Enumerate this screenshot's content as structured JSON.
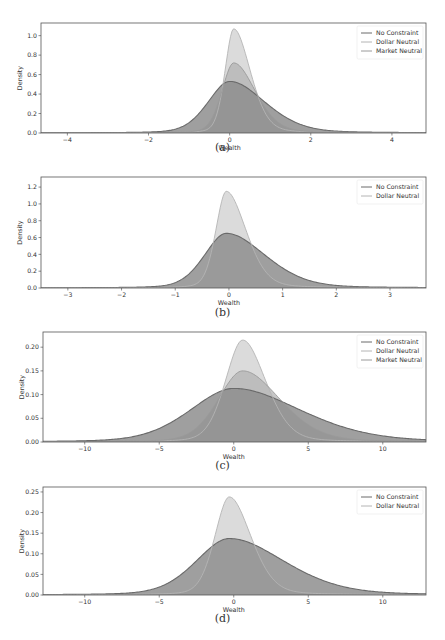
{
  "figure": {
    "captions": [
      "(a)",
      "(b)",
      "(c)",
      "(d)"
    ]
  },
  "colors": {
    "no_constraint": "#6a6a6a",
    "dollar_neutral": "#b4b4b4",
    "market_neutral": "#9a9a9a",
    "frame": "#555555"
  },
  "chart_data": [
    {
      "id": "a",
      "type": "area",
      "title": "",
      "xlabel": "Wealth",
      "ylabel": "Density",
      "xlim": [
        -4.65,
        4.84
      ],
      "ylim": [
        0.0,
        1.13
      ],
      "xticks": [
        -4,
        -2,
        0,
        2,
        4
      ],
      "xtick_labels": [
        "−4",
        "−2",
        "0",
        "2",
        "4"
      ],
      "yticks": [
        0.0,
        0.2,
        0.4,
        0.6,
        0.8,
        1.0
      ],
      "ytick_labels": [
        "0.0",
        "0.2",
        "0.4",
        "0.6",
        "0.8",
        "1.0"
      ],
      "grid": false,
      "legend_position": "upper right",
      "legend": [
        "No Constraint",
        "Dollar Neutral",
        "Market Neutral"
      ],
      "series": [
        {
          "name": "No Constraint",
          "peak_x": 0.0,
          "peak_y": 0.53,
          "left_scale": 0.55,
          "right_scale": 0.9,
          "shape": "skew"
        },
        {
          "name": "Dollar Neutral",
          "peak_x": 0.1,
          "peak_y": 1.07,
          "left_scale": 0.22,
          "right_scale": 0.42,
          "shape": "skew"
        },
        {
          "name": "Market Neutral",
          "peak_x": 0.1,
          "peak_y": 0.72,
          "left_scale": 0.3,
          "right_scale": 0.55,
          "shape": "skew"
        }
      ]
    },
    {
      "id": "b",
      "type": "area",
      "title": "",
      "xlabel": "Wealth",
      "ylabel": "Density",
      "xlim": [
        -3.5,
        3.67
      ],
      "ylim": [
        0.0,
        1.32
      ],
      "xticks": [
        -3,
        -2,
        -1,
        0,
        1,
        2,
        3
      ],
      "xtick_labels": [
        "−3",
        "−2",
        "−1",
        "0",
        "1",
        "2",
        "3"
      ],
      "yticks": [
        0.0,
        0.2,
        0.4,
        0.6,
        0.8,
        1.0,
        1.2
      ],
      "ytick_labels": [
        "0.0",
        "0.2",
        "0.4",
        "0.6",
        "0.8",
        "1.0",
        "1.2"
      ],
      "grid": false,
      "legend_position": "upper right",
      "legend": [
        "No Constraint",
        "Dollar Neutral"
      ],
      "series": [
        {
          "name": "No Constraint",
          "peak_x": -0.05,
          "peak_y": 0.65,
          "left_scale": 0.42,
          "right_scale": 0.75,
          "shape": "skew"
        },
        {
          "name": "Dollar Neutral",
          "peak_x": -0.05,
          "peak_y": 1.15,
          "left_scale": 0.2,
          "right_scale": 0.38,
          "shape": "skew"
        }
      ]
    },
    {
      "id": "c",
      "type": "area",
      "title": "",
      "xlabel": "Wealth",
      "ylabel": "Density",
      "xlim": [
        -12.8,
        12.9
      ],
      "ylim": [
        0.0,
        0.232
      ],
      "xticks": [
        -10,
        -5,
        0,
        5,
        10
      ],
      "xtick_labels": [
        "−10",
        "−5",
        "0",
        "5",
        "10"
      ],
      "yticks": [
        0.0,
        0.05,
        0.1,
        0.15,
        0.2
      ],
      "ytick_labels": [
        "0.00",
        "0.05",
        "0.10",
        "0.15",
        "0.20"
      ],
      "grid": false,
      "legend_position": "upper right",
      "legend": [
        "No Constraint",
        "Dollar Neutral",
        "Market Neutral"
      ],
      "series": [
        {
          "name": "No Constraint",
          "peak_x": 0.0,
          "peak_y": 0.113,
          "left_scale": 3.0,
          "right_scale": 4.6,
          "shape": "skew"
        },
        {
          "name": "Dollar Neutral",
          "peak_x": 0.6,
          "peak_y": 0.215,
          "left_scale": 1.2,
          "right_scale": 1.6,
          "shape": "skew"
        },
        {
          "name": "Market Neutral",
          "peak_x": 0.6,
          "peak_y": 0.15,
          "left_scale": 1.7,
          "right_scale": 2.6,
          "shape": "skew"
        }
      ]
    },
    {
      "id": "d",
      "type": "area",
      "title": "",
      "xlabel": "Wealth",
      "ylabel": "Density",
      "xlim": [
        -12.8,
        12.9
      ],
      "ylim": [
        0.0,
        0.262
      ],
      "xticks": [
        -10,
        -5,
        0,
        5,
        10
      ],
      "xtick_labels": [
        "−10",
        "−5",
        "0",
        "5",
        "10"
      ],
      "yticks": [
        0.0,
        0.05,
        0.1,
        0.15,
        0.2,
        0.25
      ],
      "ytick_labels": [
        "0.00",
        "0.05",
        "0.10",
        "0.15",
        "0.20",
        "0.25"
      ],
      "grid": false,
      "legend_position": "upper right",
      "legend": [
        "No Constraint",
        "Dollar Neutral"
      ],
      "series": [
        {
          "name": "No Constraint",
          "peak_x": -0.3,
          "peak_y": 0.137,
          "left_scale": 2.3,
          "right_scale": 3.8,
          "shape": "skew"
        },
        {
          "name": "Dollar Neutral",
          "peak_x": -0.3,
          "peak_y": 0.238,
          "left_scale": 1.0,
          "right_scale": 1.5,
          "shape": "skew"
        }
      ]
    }
  ]
}
